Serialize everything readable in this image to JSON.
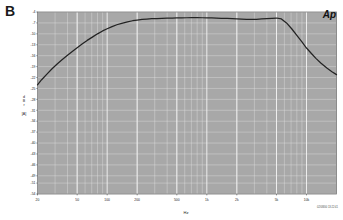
{
  "figure": {
    "panel_label": "B",
    "logo": "Ap",
    "footnote": "02/08/00 13:22:41"
  },
  "chart_data": {
    "type": "line",
    "title": "",
    "xlabel": "Hz",
    "ylabel": "dBr A",
    "ylabel_chars": [
      "d",
      "B",
      "r"
    ],
    "ylabel_suffix": "[A]",
    "xscale": "log",
    "xlim": [
      20,
      20000
    ],
    "ylim": [
      -54,
      -4
    ],
    "ytick_step": 3,
    "grid": true,
    "grid_minor": true,
    "legend": "none",
    "background_color": "#a8a8a8",
    "grid_color": "#e8e8e8",
    "line_color": "#232323",
    "xticks": [
      20,
      50,
      100,
      200,
      500,
      1000,
      2000,
      5000,
      10000
    ],
    "xticklabels": [
      "20",
      "50",
      "100",
      "200",
      "500",
      "1k",
      "2k",
      "5k",
      "10k"
    ],
    "yticks": [
      -4,
      -7,
      -10,
      -13,
      -16,
      -19,
      -22,
      -25,
      -28,
      -31,
      -34,
      -37,
      -40,
      -43,
      -46,
      -49,
      -51,
      -54
    ],
    "yticklabels": [
      "-4",
      "-7",
      "-10",
      "-13",
      "-16",
      "-19",
      "-22",
      "-25",
      "-28",
      "-31",
      "-34",
      "-37",
      "-40",
      "-43",
      "-46",
      "-49",
      "-51",
      "-54"
    ],
    "series": [
      {
        "name": "Frequency response",
        "x": [
          20,
          22,
          25,
          28,
          31.5,
          35,
          40,
          45,
          50,
          56,
          63,
          71,
          80,
          90,
          100,
          112,
          125,
          140,
          160,
          180,
          200,
          224,
          250,
          280,
          315,
          355,
          400,
          450,
          500,
          560,
          630,
          710,
          800,
          900,
          1000,
          1120,
          1250,
          1400,
          1600,
          1800,
          2000,
          2240,
          2500,
          2800,
          3150,
          3550,
          4000,
          4500,
          5000,
          5600,
          6300,
          7100,
          8000,
          9000,
          10000,
          11200,
          12500,
          14000,
          16000,
          18000,
          20000
        ],
        "y": [
          -24.0,
          -22.6,
          -21.0,
          -19.6,
          -18.3,
          -17.2,
          -15.9,
          -14.8,
          -13.8,
          -12.8,
          -11.8,
          -10.9,
          -10.0,
          -9.2,
          -8.6,
          -8.0,
          -7.5,
          -7.1,
          -6.7,
          -6.4,
          -6.2,
          -6.05,
          -5.95,
          -5.85,
          -5.8,
          -5.75,
          -5.7,
          -5.65,
          -5.62,
          -5.6,
          -5.58,
          -5.57,
          -5.57,
          -5.58,
          -5.6,
          -5.63,
          -5.67,
          -5.72,
          -5.78,
          -5.84,
          -5.9,
          -5.96,
          -6.0,
          -6.02,
          -6.0,
          -5.92,
          -5.82,
          -5.72,
          -5.65,
          -5.9,
          -7.0,
          -8.6,
          -10.4,
          -12.2,
          -13.9,
          -15.4,
          -16.8,
          -18.1,
          -19.4,
          -20.4,
          -21.2
        ]
      }
    ]
  }
}
